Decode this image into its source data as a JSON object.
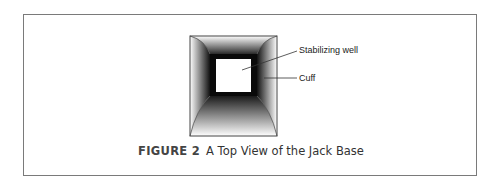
{
  "figure": {
    "number_label": "FIGURE 2",
    "title": "A Top View of the Jack Base",
    "callouts": [
      {
        "id": "stabilizing-well",
        "text": "Stabilizing well"
      },
      {
        "id": "cuff",
        "text": "Cuff"
      }
    ]
  }
}
